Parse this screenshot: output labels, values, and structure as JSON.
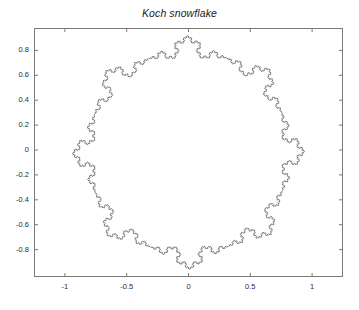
{
  "figure": {
    "width": 359,
    "height": 310,
    "background_color": "#ffffff",
    "axes_border_color": "#7a7a7a",
    "curve_color": "#3a3a3a",
    "tick_label_color": "#2b2b2b"
  },
  "chart_data": {
    "type": "line",
    "title": "Koch snowflake",
    "subtitle": "",
    "xlabel": "",
    "ylabel": "",
    "xlim": [
      -1.25,
      1.25
    ],
    "ylim": [
      -1.02,
      0.98
    ],
    "grid": false,
    "legend": null,
    "legend_position": "none",
    "tick_direction": "in",
    "xticks": [
      -1,
      -0.5,
      0,
      0.5,
      1
    ],
    "xtick_labels": [
      "-1",
      "-0.5",
      "0",
      "0.5",
      "1"
    ],
    "yticks": [
      0.8,
      0.6,
      0.4,
      0.2,
      0,
      -0.2,
      -0.4,
      -0.6,
      -0.8
    ],
    "ytick_labels": [
      "0.8",
      "0.6",
      "0.4",
      "0.2",
      "0",
      "-0.2",
      "-0.4",
      "-0.6",
      "-0.8"
    ],
    "series": [
      {
        "name": "Koch snowflake",
        "type": "closed-curve",
        "color": "#3a3a3a",
        "line_width": 0.6,
        "fill": "none",
        "generator": "koch",
        "base_polygon_sides": 8,
        "iterations": 4,
        "base_radius": 0.82,
        "rotation_deg": -22,
        "center": [
          0.0,
          -0.02
        ],
        "approx_extent": {
          "xmin": -0.95,
          "xmax": 1.0,
          "ymin": -0.92,
          "ymax": 0.95
        }
      }
    ]
  }
}
